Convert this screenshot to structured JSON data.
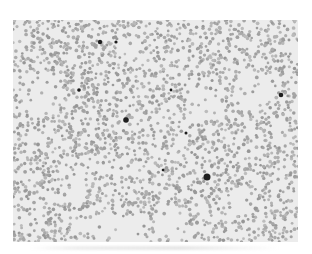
{
  "image": {
    "description": "Grayscale light micrograph of a blood smear showing densely packed red blood cells with a few dark-stained cells",
    "background_color": "#ececec",
    "cell_color": "#a9a9a9",
    "dark_cell_color": "#1e1e1e",
    "page_background": "#ffffff"
  },
  "caption": {
    "text": ""
  }
}
